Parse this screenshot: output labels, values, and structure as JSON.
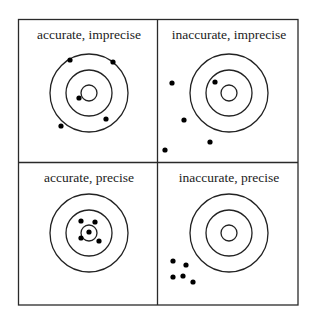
{
  "diagram": {
    "panels": [
      {
        "id": "accurate-imprecise",
        "label": "accurate, imprecise",
        "center": [
          89,
          93
        ],
        "dots": [
          [
            70,
            60
          ],
          [
            113,
            62
          ],
          [
            79,
            98
          ],
          [
            106,
            119
          ],
          [
            61,
            126
          ]
        ]
      },
      {
        "id": "inaccurate-imprecise",
        "label": "inaccurate, imprecise",
        "center": [
          229,
          93
        ],
        "dots": [
          [
            172,
            83
          ],
          [
            215,
            82
          ],
          [
            184,
            120
          ],
          [
            210,
            142
          ],
          [
            165,
            150
          ]
        ]
      },
      {
        "id": "accurate-precise",
        "label": "accurate, precise",
        "center": [
          89,
          233
        ],
        "dots": [
          [
            81,
            221
          ],
          [
            95,
            222
          ],
          [
            89,
            232
          ],
          [
            81,
            238
          ],
          [
            99,
            241
          ]
        ]
      },
      {
        "id": "inaccurate-precise",
        "label": "inaccurate, precise",
        "center": [
          229,
          233
        ],
        "dots": [
          [
            173,
            261
          ],
          [
            186,
            265
          ],
          [
            173,
            277
          ],
          [
            183,
            276
          ],
          [
            193,
            282
          ]
        ]
      }
    ],
    "rings": [
      39,
      23,
      8
    ]
  }
}
